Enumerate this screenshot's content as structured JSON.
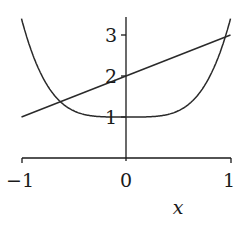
{
  "chart_data": {
    "type": "line",
    "title": "",
    "xlabel": "x",
    "ylabel": "",
    "xlim": [
      -1,
      1
    ],
    "ylim": [
      0,
      3.4
    ],
    "grid": false,
    "legend": null,
    "x_ticks": [
      -1,
      0,
      1
    ],
    "x_tick_labels": [
      "−1",
      "0",
      "1"
    ],
    "y_ticks": [
      1,
      2,
      3
    ],
    "y_tick_labels": [
      "1",
      "2",
      "3"
    ],
    "series": [
      {
        "name": "curve",
        "description": "U-shaped curve, minimum 1 at x=0, rising to about 3.4 at x=±1",
        "x": [
          -1,
          -0.9,
          -0.8,
          -0.7,
          -0.6,
          -0.5,
          -0.4,
          -0.3,
          -0.2,
          -0.1,
          0,
          0.1,
          0.2,
          0.3,
          0.4,
          0.5,
          0.6,
          0.7,
          0.8,
          0.9,
          1
        ],
        "values": [
          3.4,
          2.57,
          1.98,
          1.58,
          1.31,
          1.15,
          1.06,
          1.02,
          1.0,
          1.0,
          1.0,
          1.0,
          1.0,
          1.02,
          1.06,
          1.15,
          1.31,
          1.58,
          1.98,
          2.57,
          3.4
        ]
      },
      {
        "name": "line",
        "description": "Straight line y = x + 2",
        "x": [
          -1,
          1
        ],
        "values": [
          1,
          3
        ]
      }
    ],
    "annotations": []
  }
}
